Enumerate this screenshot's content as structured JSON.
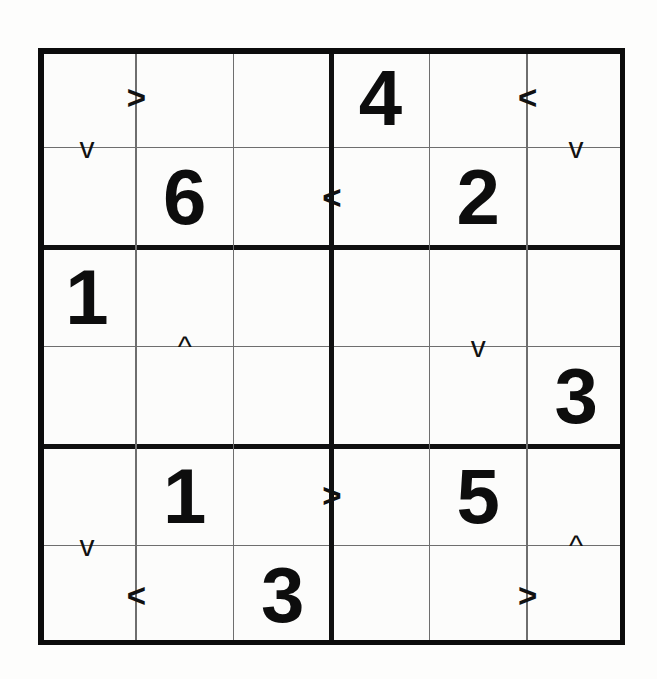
{
  "puzzle": {
    "kind": "inequality-sudoku",
    "grid_size": 6,
    "box_rows": 2,
    "box_cols": 3,
    "colors": {
      "ink": "#111111",
      "thin_rule": "#6e6e6e",
      "paper": "#fcfcfb"
    },
    "givens": [
      {
        "row": 1,
        "col": 4,
        "value": "4"
      },
      {
        "row": 2,
        "col": 2,
        "value": "6"
      },
      {
        "row": 2,
        "col": 5,
        "value": "2"
      },
      {
        "row": 3,
        "col": 1,
        "value": "1"
      },
      {
        "row": 4,
        "col": 6,
        "value": "3"
      },
      {
        "row": 5,
        "col": 2,
        "value": "1"
      },
      {
        "row": 5,
        "col": 5,
        "value": "5"
      },
      {
        "row": 6,
        "col": 3,
        "value": "3"
      }
    ],
    "empty_cells": [
      {
        "row": 1,
        "col": 1
      },
      {
        "row": 1,
        "col": 2
      },
      {
        "row": 1,
        "col": 3
      },
      {
        "row": 1,
        "col": 5
      },
      {
        "row": 1,
        "col": 6
      },
      {
        "row": 2,
        "col": 1
      },
      {
        "row": 2,
        "col": 3
      },
      {
        "row": 2,
        "col": 4
      },
      {
        "row": 2,
        "col": 6
      },
      {
        "row": 3,
        "col": 2
      },
      {
        "row": 3,
        "col": 3
      },
      {
        "row": 3,
        "col": 4
      },
      {
        "row": 3,
        "col": 5
      },
      {
        "row": 3,
        "col": 6
      },
      {
        "row": 4,
        "col": 1
      },
      {
        "row": 4,
        "col": 2
      },
      {
        "row": 4,
        "col": 3
      },
      {
        "row": 4,
        "col": 4
      },
      {
        "row": 4,
        "col": 5
      },
      {
        "row": 5,
        "col": 1
      },
      {
        "row": 5,
        "col": 3
      },
      {
        "row": 5,
        "col": 4
      },
      {
        "row": 5,
        "col": 6
      },
      {
        "row": 6,
        "col": 1
      },
      {
        "row": 6,
        "col": 2
      },
      {
        "row": 6,
        "col": 4
      },
      {
        "row": 6,
        "col": 5
      },
      {
        "row": 6,
        "col": 6
      }
    ],
    "inequalities": [
      {
        "id": "h-r1-c1c2",
        "orientation": "horizontal",
        "glyph": ">",
        "row": 1,
        "left_col": 1,
        "right_col": 2
      },
      {
        "id": "v-c1-r1r2",
        "orientation": "vertical",
        "glyph": "v",
        "col": 1,
        "top_row": 1,
        "bottom_row": 2
      },
      {
        "id": "h-r1-c5c6",
        "orientation": "horizontal",
        "glyph": "<",
        "row": 1,
        "left_col": 5,
        "right_col": 6
      },
      {
        "id": "v-c6-r1r2",
        "orientation": "vertical",
        "glyph": "v",
        "col": 6,
        "top_row": 1,
        "bottom_row": 2
      },
      {
        "id": "h-r2-c3c4",
        "orientation": "horizontal",
        "glyph": "<",
        "row": 2,
        "left_col": 3,
        "right_col": 4
      },
      {
        "id": "v-c2-r3r4",
        "orientation": "vertical",
        "glyph": "^",
        "col": 2,
        "top_row": 3,
        "bottom_row": 4
      },
      {
        "id": "v-c5-r3r4",
        "orientation": "vertical",
        "glyph": "v",
        "col": 5,
        "top_row": 3,
        "bottom_row": 4
      },
      {
        "id": "h-r5-c3c4",
        "orientation": "horizontal",
        "glyph": ">",
        "row": 5,
        "left_col": 3,
        "right_col": 4
      },
      {
        "id": "v-c1-r5r6",
        "orientation": "vertical",
        "glyph": "v",
        "col": 1,
        "top_row": 5,
        "bottom_row": 6
      },
      {
        "id": "v-c6-r5r6",
        "orientation": "vertical",
        "glyph": "^",
        "col": 6,
        "top_row": 5,
        "bottom_row": 6
      },
      {
        "id": "h-r6-c1c2",
        "orientation": "horizontal",
        "glyph": "<",
        "row": 6,
        "left_col": 1,
        "right_col": 2
      },
      {
        "id": "h-r6-c5c6",
        "orientation": "horizontal",
        "glyph": ">",
        "row": 6,
        "left_col": 5,
        "right_col": 6
      }
    ]
  }
}
